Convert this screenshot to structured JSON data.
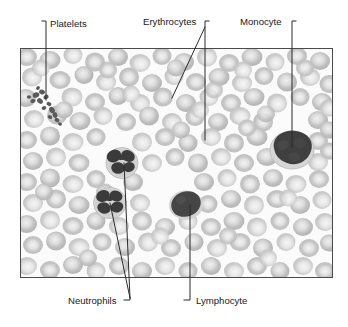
{
  "figure": {
    "kind": "micrograph",
    "frame": {
      "x": 20,
      "y": 48,
      "width": 313,
      "height": 230,
      "border_color": "#4a4a4a",
      "background_color": "#fbfbfb"
    },
    "labels": [
      {
        "id": "platelets",
        "text": "Platelets",
        "x": 50,
        "y": 27,
        "anchor": "start",
        "position": "top"
      },
      {
        "id": "erythrocytes",
        "text": "Erythrocytes",
        "x": 143,
        "y": 25,
        "anchor": "start",
        "position": "top"
      },
      {
        "id": "monocyte",
        "text": "Monocyte",
        "x": 240,
        "y": 25,
        "anchor": "start",
        "position": "top"
      },
      {
        "id": "neutrophils",
        "text": "Neutrophils",
        "x": 68,
        "y": 303,
        "anchor": "start",
        "position": "bottom"
      },
      {
        "id": "lymphocyte",
        "text": "Lymphocyte",
        "x": 196,
        "y": 303,
        "anchor": "start",
        "position": "bottom"
      }
    ],
    "leaders": [
      {
        "id": "platelets-leader",
        "for": "platelets",
        "points": "46,23 46,100"
      },
      {
        "id": "erythrocytes-leader-1",
        "for": "erythrocytes",
        "points": "205,23 205,140"
      },
      {
        "id": "erythrocytes-leader-2",
        "for": "erythrocytes",
        "points": "205,27 172,98"
      },
      {
        "id": "monocyte-leader",
        "for": "monocyte",
        "points": "292,23 292,147"
      },
      {
        "id": "neutrophils-leader-1",
        "for": "neutrophils",
        "points": "130,297 124,163"
      },
      {
        "id": "neutrophils-leader-2",
        "for": "neutrophils",
        "points": "130,297 110,203"
      },
      {
        "id": "lymphocyte-leader",
        "for": "lymphocyte",
        "points": "190,297 190,205"
      }
    ],
    "cell_types": {
      "erythrocyte": {
        "label": "Erythrocytes",
        "color": "#c9c9c9",
        "pale_center": "#ececec",
        "count_visible": 176
      },
      "neutrophil": {
        "label": "Neutrophils",
        "nucleus_color": "#3a3a3a",
        "cytoplasm_color": "#d8d8d8",
        "count_visible": 2
      },
      "lymphocyte": {
        "label": "Lymphocyte",
        "nucleus_color": "#434343",
        "cytoplasm_color": "#d4d4d4",
        "count_visible": 1
      },
      "monocyte": {
        "label": "Monocyte",
        "nucleus_color": "#3d3d3d",
        "cytoplasm_color": "#d9d9d9",
        "count_visible": 1
      },
      "platelet": {
        "label": "Platelets",
        "color": "#555555",
        "count_visible": 14
      }
    },
    "colors": {
      "leader_line": "#2b2b2b",
      "label_text": "#1a1a1a",
      "frame_border": "#4a4a4a",
      "field_background": "#fbfbfb"
    }
  }
}
